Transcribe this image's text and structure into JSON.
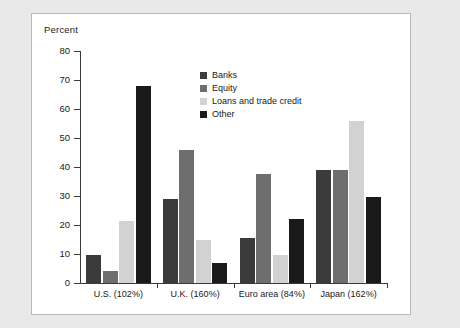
{
  "chart_data": {
    "type": "bar",
    "title": "",
    "ylabel": "Percent",
    "xlabel": "",
    "ylim": [
      0,
      80
    ],
    "yticks": [
      0,
      10,
      20,
      30,
      40,
      50,
      60,
      70,
      80
    ],
    "grid": false,
    "legend_position": "inside-top-center",
    "categories": [
      "U.S. (102%)",
      "U.K. (160%)",
      "Euro area (84%)",
      "Japan (162%)"
    ],
    "series": [
      {
        "name": "Banks",
        "color": "#3b3b3b",
        "values": [
          9.5,
          29,
          15.5,
          39
        ]
      },
      {
        "name": "Equity",
        "color": "#6e6e6e",
        "values": [
          4,
          46,
          37.5,
          39
        ]
      },
      {
        "name": "Loans and trade credit",
        "color": "#d2d2d2",
        "values": [
          21.5,
          15,
          9.5,
          56
        ]
      },
      {
        "name": "Other",
        "color": "#1a1a1a",
        "values": [
          68,
          7,
          22,
          29.5
        ]
      }
    ]
  },
  "panel": {
    "background": "#ffffff",
    "border_color": "#b9b9b9",
    "page_background": "#e9e9e9",
    "axis_color": "#3a3a3a",
    "text_color": "#1a1a1a"
  }
}
